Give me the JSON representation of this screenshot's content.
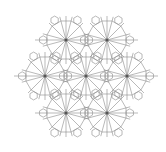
{
  "diagram": {
    "colors": {
      "background": "#ffffff",
      "stroke": "#8a8a8a",
      "center": "#555555"
    },
    "rosette_radius": 24,
    "rays": 12,
    "rosettes": [
      {
        "cx": 66,
        "cy": 40
      },
      {
        "cx": 107,
        "cy": 40
      },
      {
        "cx": 45,
        "cy": 76
      },
      {
        "cx": 86,
        "cy": 76
      },
      {
        "cx": 127,
        "cy": 76
      },
      {
        "cx": 66,
        "cy": 113
      },
      {
        "cx": 107,
        "cy": 113
      }
    ],
    "horizontal_lines": [
      {
        "x1": 35,
        "x2": 138,
        "y": 40
      },
      {
        "x1": 14,
        "x2": 158,
        "y": 76
      },
      {
        "x1": 35,
        "x2": 138,
        "y": 113
      }
    ]
  }
}
